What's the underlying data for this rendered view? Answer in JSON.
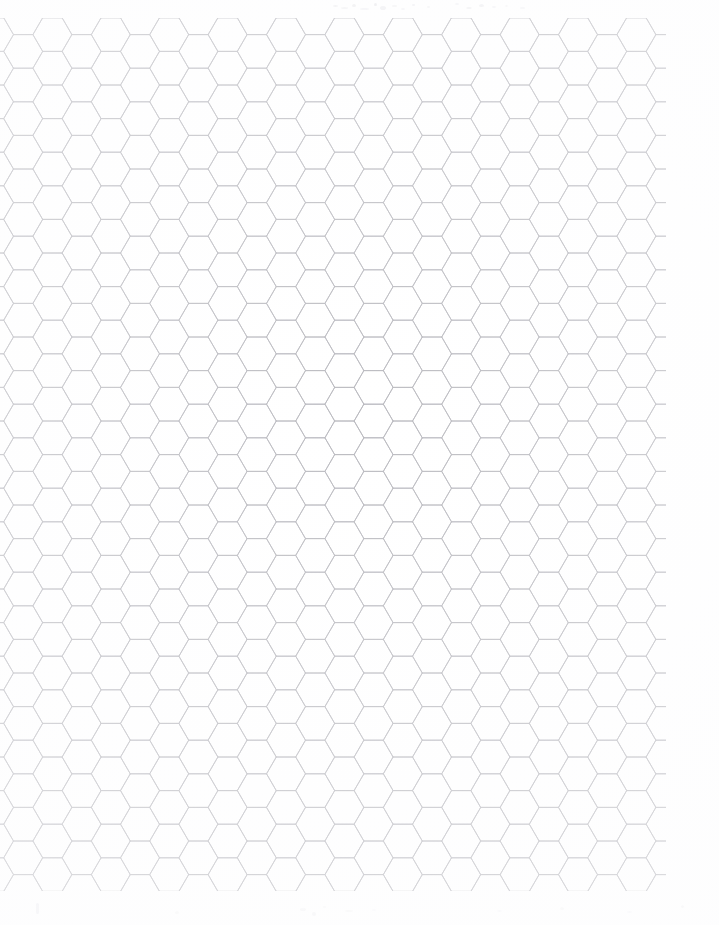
{
  "document": {
    "kind": "scanned-sheet",
    "title": "Hexagonal Graph Paper",
    "description": "Blank hex grid / honeycomb graph paper sheet, scanned",
    "page_width": 719,
    "page_height": 925,
    "background_color": "#ffffff",
    "text_content": "",
    "visible_labels": []
  },
  "grid": {
    "type": "hexagonal",
    "orientation": "pointy-left-right",
    "line_color": "#b9b9be",
    "line_width": 0.9,
    "hex_width": 39,
    "hex_height": 33.6,
    "column_step": 29.2,
    "row_step": 33.6,
    "column_vertical_offset": 16.8,
    "columns": 23,
    "rows": 27,
    "origin_x": -6,
    "origin_y": 1,
    "area_left": 0,
    "area_top": 18,
    "area_right": 666,
    "area_bottom": 891
  },
  "artifacts": {
    "top_smudge_color": "#d8d8dd",
    "bottom_smudge_color": "#e2e2e6",
    "top_specks": [
      {
        "x": 333,
        "y": 5,
        "w": 5,
        "h": 2,
        "o": 0.3
      },
      {
        "x": 341,
        "y": 7,
        "w": 7,
        "h": 2,
        "o": 0.24
      },
      {
        "x": 352,
        "y": 4,
        "w": 4,
        "h": 3,
        "o": 0.34
      },
      {
        "x": 360,
        "y": 8,
        "w": 9,
        "h": 2,
        "o": 0.22
      },
      {
        "x": 374,
        "y": 3,
        "w": 3,
        "h": 3,
        "o": 0.4
      },
      {
        "x": 380,
        "y": 6,
        "w": 6,
        "h": 4,
        "o": 0.3
      },
      {
        "x": 392,
        "y": 5,
        "w": 5,
        "h": 2,
        "o": 0.26
      },
      {
        "x": 401,
        "y": 8,
        "w": 4,
        "h": 2,
        "o": 0.22
      },
      {
        "x": 412,
        "y": 4,
        "w": 3,
        "h": 2,
        "o": 0.28
      },
      {
        "x": 427,
        "y": 6,
        "w": 3,
        "h": 2,
        "o": 0.2
      },
      {
        "x": 455,
        "y": 3,
        "w": 4,
        "h": 2,
        "o": 0.22
      },
      {
        "x": 466,
        "y": 7,
        "w": 6,
        "h": 2,
        "o": 0.26
      },
      {
        "x": 479,
        "y": 4,
        "w": 5,
        "h": 3,
        "o": 0.3
      },
      {
        "x": 492,
        "y": 6,
        "w": 4,
        "h": 2,
        "o": 0.22
      },
      {
        "x": 505,
        "y": 5,
        "w": 3,
        "h": 2,
        "o": 0.18
      },
      {
        "x": 520,
        "y": 7,
        "w": 5,
        "h": 2,
        "o": 0.2
      }
    ],
    "bottom_specks": [
      {
        "x": 36,
        "y": 903,
        "w": 3,
        "h": 11,
        "o": 0.26
      },
      {
        "x": 175,
        "y": 911,
        "w": 4,
        "h": 3,
        "o": 0.18
      },
      {
        "x": 300,
        "y": 908,
        "w": 6,
        "h": 3,
        "o": 0.2
      },
      {
        "x": 312,
        "y": 912,
        "w": 4,
        "h": 4,
        "o": 0.24
      },
      {
        "x": 323,
        "y": 906,
        "w": 3,
        "h": 2,
        "o": 0.16
      },
      {
        "x": 345,
        "y": 910,
        "w": 8,
        "h": 2,
        "o": 0.18
      },
      {
        "x": 372,
        "y": 909,
        "w": 4,
        "h": 2,
        "o": 0.16
      },
      {
        "x": 497,
        "y": 910,
        "w": 5,
        "h": 2,
        "o": 0.16
      },
      {
        "x": 560,
        "y": 907,
        "w": 4,
        "h": 3,
        "o": 0.18
      },
      {
        "x": 627,
        "y": 911,
        "w": 5,
        "h": 2,
        "o": 0.16
      },
      {
        "x": 681,
        "y": 905,
        "w": 3,
        "h": 3,
        "o": 0.2
      }
    ]
  }
}
